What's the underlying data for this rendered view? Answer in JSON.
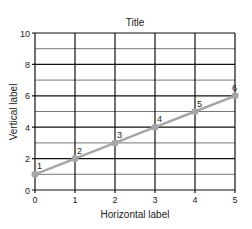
{
  "chart_data": {
    "type": "line",
    "title": "Title",
    "xlabel": "Horizontal label",
    "ylabel": "Vertical label",
    "xlim": [
      0,
      5
    ],
    "ylim": [
      0,
      10
    ],
    "x_ticks": [
      0,
      1,
      2,
      3,
      4,
      5
    ],
    "y_ticks": [
      0,
      2,
      4,
      6,
      8,
      10
    ],
    "y_minor_ticks": [
      1,
      3,
      5,
      7,
      9
    ],
    "grid": true,
    "legend": null,
    "series": [
      {
        "name": "series-1",
        "x": [
          0,
          1,
          2,
          3,
          4,
          5
        ],
        "values": [
          1,
          2,
          3,
          4,
          5,
          6
        ],
        "point_labels": [
          "1",
          "2",
          "3",
          "4",
          "5",
          "6"
        ],
        "color": "#a6a6a6"
      }
    ]
  },
  "colors": {
    "major_grid": "#111111",
    "minor_grid": "#555555",
    "line": "#a6a6a6",
    "text": "#222222"
  }
}
